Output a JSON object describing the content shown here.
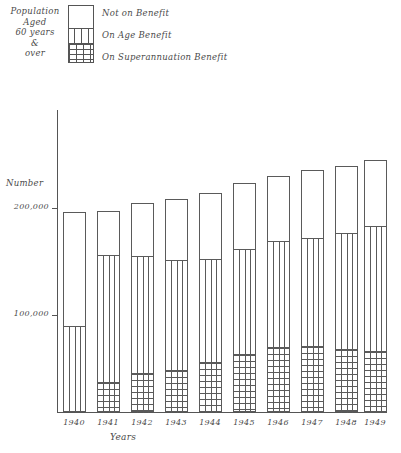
{
  "legend": {
    "caption_lines": [
      "Population",
      "Aged",
      "60 years",
      "&",
      "over"
    ],
    "items": [
      {
        "label": "Not on Benefit",
        "pattern": "blank"
      },
      {
        "label": "On Age Benefit",
        "pattern": "vertical-lines"
      },
      {
        "label": "On Superannuation Benefit",
        "pattern": "cross-hatch"
      }
    ]
  },
  "axes": {
    "y_title": "Number",
    "x_title": "Years",
    "y_ticks": [
      "200,000",
      "100,000"
    ]
  },
  "chart_data": {
    "type": "bar",
    "title": "",
    "subtitle": "",
    "xlabel": "Years",
    "ylabel": "Number",
    "ylim": [
      0,
      230000
    ],
    "y_ticks": [
      100000,
      200000
    ],
    "grid": false,
    "legend_position": "top-left",
    "stacked": true,
    "categories": [
      "1940",
      "1941",
      "1942",
      "1943",
      "1944",
      "1945",
      "1946",
      "1947",
      "1948",
      "1949"
    ],
    "series": [
      {
        "name": "On Superannuation Benefit",
        "pattern": "cross-hatch",
        "values": [
          0,
          31000,
          41000,
          44000,
          52000,
          61000,
          68000,
          69000,
          66000,
          64000
        ]
      },
      {
        "name": "On Age Benefit",
        "pattern": "vertical-lines",
        "values": [
          90000,
          131000,
          121000,
          113000,
          106000,
          108000,
          109000,
          111000,
          120000,
          129000
        ]
      },
      {
        "name": "Not on Benefit",
        "pattern": "blank",
        "values": [
          116000,
          44000,
          53000,
          62000,
          67000,
          67000,
          66000,
          69000,
          68000,
          67000
        ]
      }
    ],
    "totals": [
      206000,
      206000,
      215000,
      219000,
      225000,
      236000,
      243000,
      249000,
      254000,
      260000
    ]
  },
  "bars": [
    {
      "year": "1940",
      "x": 63,
      "top": 212,
      "none_bottom": 325,
      "age_bottom": 411
    },
    {
      "year": "1941",
      "x": 97,
      "top": 211,
      "none_bottom": 254,
      "age_bottom": 381
    },
    {
      "year": "1942",
      "x": 131,
      "top": 203,
      "none_bottom": 255,
      "age_bottom": 372
    },
    {
      "year": "1943",
      "x": 165,
      "top": 199,
      "none_bottom": 259,
      "age_bottom": 369
    },
    {
      "year": "1944",
      "x": 199,
      "top": 193,
      "none_bottom": 258,
      "age_bottom": 361
    },
    {
      "year": "1945",
      "x": 233,
      "top": 183,
      "none_bottom": 248,
      "age_bottom": 353
    },
    {
      "year": "1946",
      "x": 267,
      "top": 176,
      "none_bottom": 240,
      "age_bottom": 346
    },
    {
      "year": "1947",
      "x": 301,
      "top": 170,
      "none_bottom": 237,
      "age_bottom": 345
    },
    {
      "year": "1948",
      "x": 335,
      "top": 166,
      "none_bottom": 232,
      "age_bottom": 348
    },
    {
      "year": "1949",
      "x": 364,
      "top": 160,
      "none_bottom": 225,
      "age_bottom": 350
    }
  ]
}
